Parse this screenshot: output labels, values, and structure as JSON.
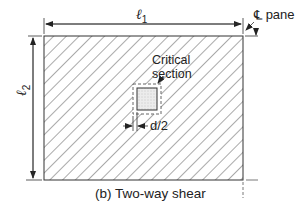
{
  "diagram": {
    "caption": "(b) Two-way shear",
    "dimension_l1": {
      "symbol": "ℓ",
      "subscript": "1"
    },
    "dimension_l2": {
      "symbol": "ℓ",
      "subscript": "2"
    },
    "centerline_label": {
      "symbol": "℄",
      "text": "pane"
    },
    "critical_section_label": {
      "line1": "Critical",
      "line2": "section"
    },
    "offset_label": "d/2",
    "colors": {
      "line": "#333333",
      "hatch": "#555555",
      "dash": "#666666",
      "column_fill": "#e8e8e8"
    }
  }
}
